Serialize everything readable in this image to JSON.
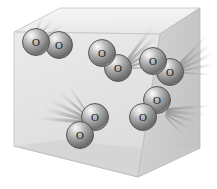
{
  "illustration": {
    "title": "Oxygen molecules in a gas container",
    "caption": "",
    "container": {
      "name": "cube-container",
      "shape": "cube",
      "faces": {
        "top": {
          "label": "top-face",
          "color": "#f2f2f2",
          "points": "14,32 60,8 200,8 160,34"
        },
        "front": {
          "label": "front-face",
          "color": "#e6e6e6",
          "points": "14,32 160,34 138,177 14,146"
        },
        "right": {
          "label": "right-face",
          "color": "#cfcfcf",
          "points": "160,34 200,8 200,148 138,177"
        }
      },
      "edge_color": "#b5b5b5",
      "shadow_color": "#c9c9c9"
    },
    "molecules": [
      {
        "id": "molecule-1",
        "formula": "O2",
        "atoms": [
          {
            "label": "O",
            "cx": 36,
            "cy": 42,
            "r": 13
          },
          {
            "label": "O",
            "cx": 59,
            "cy": 45,
            "r": 13
          }
        ],
        "streak_direction": "down-left",
        "streak_count": 5
      },
      {
        "id": "molecule-2",
        "formula": "O2",
        "atoms": [
          {
            "label": "O",
            "cx": 102,
            "cy": 53,
            "r": 13
          },
          {
            "label": "O",
            "cx": 118,
            "cy": 68,
            "r": 13
          }
        ],
        "streak_direction": "up-right",
        "streak_count": 5
      },
      {
        "id": "molecule-3",
        "formula": "O2",
        "atoms": [
          {
            "label": "O",
            "cx": 153,
            "cy": 61,
            "r": 13
          },
          {
            "label": "O",
            "cx": 170,
            "cy": 72,
            "r": 13
          }
        ],
        "streak_direction": "up-right",
        "streak_count": 5
      },
      {
        "id": "molecule-4",
        "formula": "O2",
        "atoms": [
          {
            "label": "O",
            "cx": 157,
            "cy": 100,
            "r": 13
          },
          {
            "label": "O",
            "cx": 143,
            "cy": 117,
            "r": 13
          }
        ],
        "streak_direction": "right",
        "streak_count": 5
      },
      {
        "id": "molecule-5",
        "formula": "O2",
        "atoms": [
          {
            "label": "O",
            "cx": 95,
            "cy": 117,
            "r": 13
          },
          {
            "label": "O",
            "cx": 80,
            "cy": 135,
            "r": 13
          }
        ],
        "streak_direction": "up-left",
        "streak_count": 5
      }
    ],
    "palette": {
      "atom_highlight": "#f5f5f5",
      "atom_mid": "#9e9e9e",
      "atom_shadow": "#5d5d5d",
      "atom_outline": "#4a4a4a",
      "atom_letter": "#1a1a1a",
      "streak": "#a8a8a8",
      "background": "#ffffff"
    }
  }
}
